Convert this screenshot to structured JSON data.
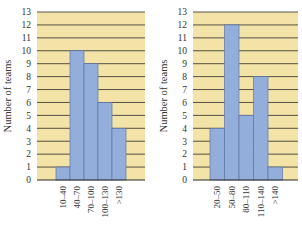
{
  "colors": {
    "background": "#f3e3a6",
    "bar_fill": "#94aedb",
    "bar_stroke": "#5d76a8",
    "grid": "#2b2b2b",
    "axis": "#2b2b2b"
  },
  "chart_data": [
    {
      "type": "bar",
      "title": "",
      "xlabel": "",
      "ylabel": "Number of teams",
      "ylim": [
        0,
        13
      ],
      "yticks": [
        "0",
        "1",
        "2",
        "3",
        "4",
        "5",
        "6",
        "7",
        "8",
        "9",
        "10",
        "11",
        "12",
        "13"
      ],
      "grid": true,
      "categories": [
        "10–40",
        "40–70",
        "70–100",
        "100–130",
        ">130"
      ],
      "values": [
        1,
        10,
        9,
        6,
        4
      ]
    },
    {
      "type": "bar",
      "title": "",
      "xlabel": "",
      "ylabel": "Number of teams",
      "ylim": [
        0,
        13
      ],
      "yticks": [
        "0",
        "1",
        "2",
        "3",
        "4",
        "5",
        "6",
        "7",
        "8",
        "9",
        "10",
        "11",
        "12",
        "13"
      ],
      "grid": true,
      "categories": [
        "20–50",
        "50–80",
        "80–110",
        "110–140",
        ">140"
      ],
      "values": [
        4,
        12,
        5,
        8,
        1
      ]
    }
  ]
}
